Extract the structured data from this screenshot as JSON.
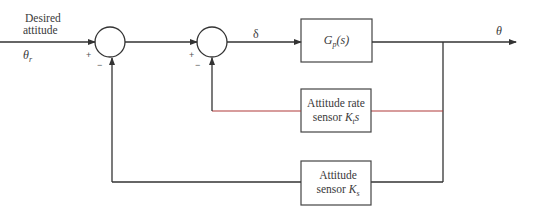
{
  "diagram": {
    "type": "block-diagram",
    "input": {
      "label_line1": "Desired",
      "label_line2": "attitude",
      "symbol": "θ",
      "symbol_sub": "r"
    },
    "junctions": [
      {
        "id": "sum1",
        "plus": "+",
        "minus": "−"
      },
      {
        "id": "sum2",
        "plus": "+",
        "minus": "−"
      }
    ],
    "signal_delta": "δ",
    "blocks": {
      "plant": {
        "main": "G",
        "sub": "p",
        "arg": "(s)"
      },
      "rate_sensor": {
        "line1": "Attitude rate",
        "line2_text": "sensor ",
        "line2_var": "K",
        "line2_sub": "t",
        "line2_suffix": "s"
      },
      "attitude_sensor": {
        "line1": "Attitude",
        "line2_text": "sensor ",
        "line2_var": "K",
        "line2_sub": "s"
      }
    },
    "output": {
      "symbol": "θ"
    },
    "colors": {
      "line": "#333333",
      "rate_feedback_line": "#b03a3a",
      "box_border": "#444444"
    }
  }
}
